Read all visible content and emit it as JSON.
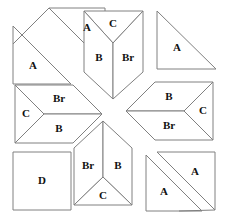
{
  "figure": {
    "kind": "quilt-block-piecing-diagram",
    "background_color": "#ffffff",
    "line_color": "#808080",
    "label_color": "#111111"
  },
  "pieces": [
    {
      "id": "a-top-left-upper",
      "label": "A",
      "name": "piece-a-top-left-upper",
      "points": "49,8 105,8 105,64",
      "lx": 87,
      "ly": 28
    },
    {
      "id": "a-top-left-lower",
      "label": "A",
      "name": "piece-a-top-left-lower",
      "points": "13,26 13,84 71,84",
      "lx": 33,
      "ly": 66
    },
    {
      "id": "c-top-center",
      "label": "C",
      "name": "piece-c-top-center",
      "points": "84,11 143,11 113,43",
      "lx": 113,
      "ly": 24
    },
    {
      "id": "b-top-center",
      "label": "B",
      "name": "piece-b-top-center",
      "points": "84,11 113,43 113,99 84,72",
      "lx": 99,
      "ly": 58
    },
    {
      "id": "br-top-center",
      "label": "Br",
      "name": "piece-br-top-center",
      "points": "143,11 143,72 113,99 113,43",
      "lx": 128,
      "ly": 58
    },
    {
      "id": "a-top-right",
      "label": "A",
      "name": "piece-a-top-right",
      "points": "157,11 157,69 216,69",
      "lx": 177,
      "ly": 48
    },
    {
      "id": "c-mid-left",
      "label": "C",
      "name": "piece-c-mid-left",
      "points": "15,85 44,114 15,143",
      "lx": 26,
      "ly": 114
    },
    {
      "id": "br-mid-left",
      "label": "Br",
      "name": "piece-br-mid-left",
      "points": "15,85 73,85 102,114 44,114",
      "lx": 59,
      "ly": 99
    },
    {
      "id": "b-mid-left",
      "label": "B",
      "name": "piece-b-mid-left",
      "points": "44,114 102,114 73,143 15,143",
      "lx": 59,
      "ly": 129
    },
    {
      "id": "b-mid-right",
      "label": "B",
      "name": "piece-b-mid-right",
      "points": "155,82 213,82 184,111 126,111",
      "lx": 169,
      "ly": 97
    },
    {
      "id": "br-mid-right",
      "label": "Br",
      "name": "piece-br-mid-right",
      "points": "126,111 184,111 213,140 155,140",
      "lx": 169,
      "ly": 126
    },
    {
      "id": "c-mid-right",
      "label": "C",
      "name": "piece-c-mid-right",
      "points": "213,82 213,140 184,111",
      "lx": 203,
      "ly": 111
    },
    {
      "id": "d-bottom-left",
      "label": "D",
      "name": "piece-d-bottom-left",
      "points": "13,152 71,152 71,210 13,210",
      "lx": 42,
      "ly": 181
    },
    {
      "id": "br-bottom-center",
      "label": "Br",
      "name": "piece-br-bottom-center",
      "points": "74,148 103,121 103,177 74,205",
      "lx": 88,
      "ly": 166
    },
    {
      "id": "b-bottom-center",
      "label": "B",
      "name": "piece-b-bottom-center",
      "points": "103,121 132,148 132,205 103,177",
      "lx": 118,
      "ly": 166
    },
    {
      "id": "c-bottom-center",
      "label": "C",
      "name": "piece-c-bottom-center",
      "points": "74,205 103,177 132,205",
      "lx": 103,
      "ly": 196
    },
    {
      "id": "a-bottom-right-upper",
      "label": "A",
      "name": "piece-a-bottom-right-upper",
      "points": "157,152 215,152 215,210",
      "lx": 195,
      "ly": 172
    },
    {
      "id": "a-bottom-right-lower",
      "label": "A",
      "name": "piece-a-bottom-right-lower",
      "points": "146,155 146,211 202,211",
      "lx": 164,
      "ly": 192
    }
  ],
  "sash": {
    "name": "diagonal-sash",
    "segments": [
      {
        "name": "sash-upper-left-edge",
        "points": "49,8 13,44"
      },
      {
        "name": "sash-lower-right-edge",
        "points": "215,210 179,211"
      }
    ]
  }
}
